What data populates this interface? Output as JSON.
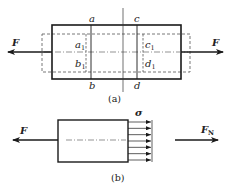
{
  "figure_a": {
    "caption": "(a)",
    "force_left": "F",
    "force_right": "F",
    "section_labels": {
      "a": "a",
      "b": "b",
      "c": "c",
      "d": "d"
    },
    "deformed_labels": {
      "a1": "a",
      "a1_sub": "1",
      "b1": "b",
      "b1_sub": "1",
      "c1": "c",
      "c1_sub": "1",
      "d1": "d",
      "d1_sub": "1"
    }
  },
  "figure_b": {
    "caption": "(b)",
    "force_left": "F",
    "stress_label": "σ",
    "internal_force": "F",
    "internal_force_sub": "N",
    "stress_arrow_count": 7
  },
  "colors": {
    "line": "#1a1a1a",
    "dashed": "#555555"
  }
}
